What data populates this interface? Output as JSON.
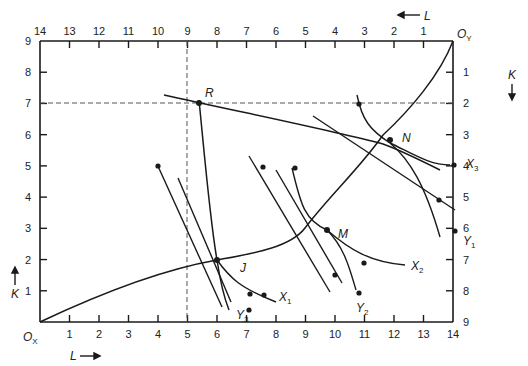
{
  "diagram": {
    "type": "edgeworth-production-box",
    "box": {
      "origin_x_label": "O",
      "origin_x_sub": "X",
      "origin_y_label": "O",
      "origin_y_sub": "Y",
      "L_total": 14,
      "K_total": 9
    },
    "axes": {
      "bottom": {
        "label": "L",
        "arrow": "right",
        "ticks": [
          "1",
          "2",
          "3",
          "4",
          "5",
          "6",
          "7",
          "8",
          "9",
          "10",
          "11",
          "12",
          "13",
          "14"
        ]
      },
      "top": {
        "label": "L",
        "arrow": "left",
        "ticks": [
          "14",
          "13",
          "12",
          "11",
          "10",
          "9",
          "8",
          "7",
          "6",
          "5",
          "4",
          "3",
          "2",
          "1"
        ]
      },
      "left": {
        "label": "K",
        "arrow": "up",
        "ticks": [
          "1",
          "2",
          "3",
          "4",
          "5",
          "6",
          "7",
          "8",
          "9"
        ]
      },
      "right": {
        "label": "K",
        "arrow": "down",
        "ticks": [
          "1",
          "2",
          "3",
          "4",
          "5",
          "6",
          "7",
          "8",
          "9"
        ]
      }
    },
    "points": [
      {
        "name": "R",
        "L": 5,
        "K": 7
      },
      {
        "name": "J",
        "L": 6,
        "K": 2
      },
      {
        "name": "M",
        "L": 9,
        "K": 3
      },
      {
        "name": "N",
        "L": 11,
        "K": 5
      }
    ],
    "isoquants": [
      {
        "label": "X",
        "sub": "1"
      },
      {
        "label": "X",
        "sub": "2"
      },
      {
        "label": "X",
        "sub": "3"
      },
      {
        "label": "Y",
        "sub": "1"
      },
      {
        "label": "Y",
        "sub": "2"
      },
      {
        "label": "Y",
        "sub": "3"
      }
    ],
    "curve": "contract curve from O_X through J, M, N to O_Y",
    "dashed_guides": [
      "vertical at L=5",
      "horizontal at K=7"
    ]
  }
}
